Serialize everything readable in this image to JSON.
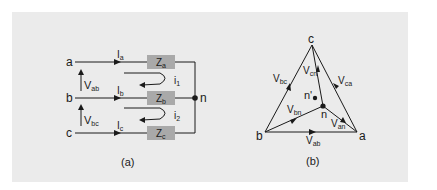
{
  "figure_a": {
    "caption": "(a)",
    "nodes": {
      "a": "a",
      "b": "b",
      "c": "c",
      "n": "n"
    },
    "currents": [
      {
        "main": "I",
        "sub": "a"
      },
      {
        "main": "I",
        "sub": "b"
      },
      {
        "main": "I",
        "sub": "c"
      }
    ],
    "voltages": [
      {
        "main": "V",
        "sub": "ab"
      },
      {
        "main": "V",
        "sub": "bc"
      }
    ],
    "loop_currents": [
      {
        "main": "i",
        "sub": "1"
      },
      {
        "main": "i",
        "sub": "2"
      }
    ],
    "impedances": [
      {
        "main": "Z",
        "sub": "a"
      },
      {
        "main": "Z",
        "sub": "b"
      },
      {
        "main": "Z",
        "sub": "c"
      }
    ]
  },
  "figure_b": {
    "caption": "(b)",
    "vertices": {
      "a": "a",
      "b": "b",
      "c": "c"
    },
    "points": {
      "n": "n",
      "n_prime": "n'"
    },
    "phasors": [
      {
        "main": "V",
        "sub": "bc"
      },
      {
        "main": "V",
        "sub": "ca"
      },
      {
        "main": "V",
        "sub": "ab"
      },
      {
        "main": "V",
        "sub": "cn"
      },
      {
        "main": "V",
        "sub": "bn"
      },
      {
        "main": "V",
        "sub": "an"
      }
    ]
  },
  "colors": {
    "panel_bg": "#ebebeb",
    "impedance_fill": "#a9a9a9",
    "line": "#1a1a1a"
  }
}
